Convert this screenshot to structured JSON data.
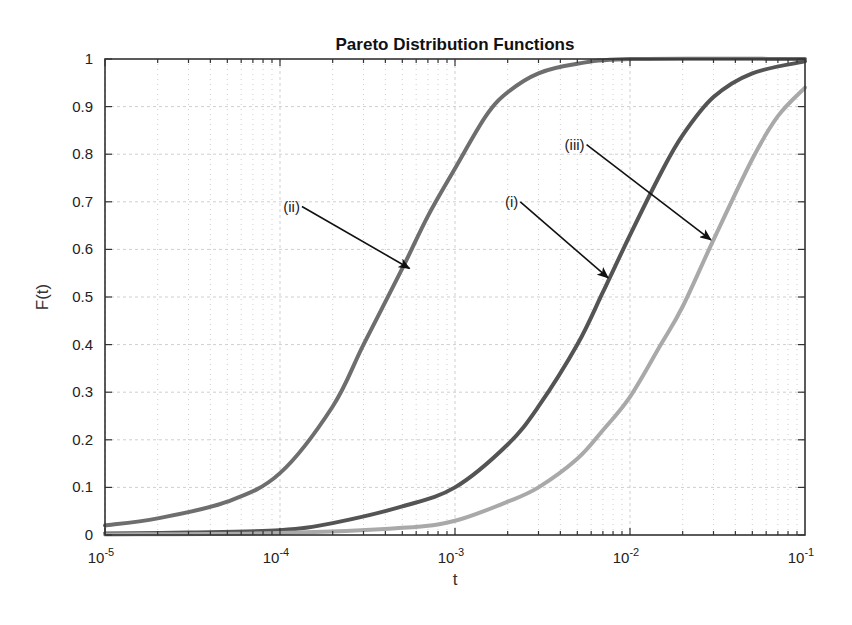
{
  "chart_data": {
    "type": "line",
    "title": "Pareto Distribution Functions",
    "xlabel": "t",
    "ylabel": "F(t)",
    "xscale": "log",
    "xlim": [
      1e-05,
      0.1
    ],
    "ylim": [
      0,
      1
    ],
    "grid": true,
    "minor_grid": true,
    "legend": null,
    "x_ticks": [
      {
        "value": 1e-05,
        "base": "10",
        "exp": "-5"
      },
      {
        "value": 0.0001,
        "base": "10",
        "exp": "-4"
      },
      {
        "value": 0.001,
        "base": "10",
        "exp": "-3"
      },
      {
        "value": 0.01,
        "base": "10",
        "exp": "-2"
      },
      {
        "value": 0.1,
        "base": "10",
        "exp": "-1"
      }
    ],
    "y_ticks": [
      "0",
      "0.1",
      "0.2",
      "0.3",
      "0.4",
      "0.5",
      "0.6",
      "0.7",
      "0.8",
      "0.9",
      "1"
    ],
    "series": [
      {
        "name": "(ii)",
        "color": "#6e6e6e",
        "x": [
          1e-05,
          2e-05,
          5e-05,
          0.0001,
          0.0002,
          0.0003,
          0.0005,
          0.0007,
          0.001,
          0.0015,
          0.002,
          0.003,
          0.005,
          0.01,
          0.1
        ],
        "y": [
          0.02,
          0.035,
          0.07,
          0.13,
          0.27,
          0.4,
          0.56,
          0.67,
          0.77,
          0.88,
          0.93,
          0.97,
          0.99,
          1.0,
          1.0
        ]
      },
      {
        "name": "(i)",
        "color": "#545454",
        "x": [
          1e-05,
          3e-05,
          0.0001,
          0.0002,
          0.0005,
          0.001,
          0.002,
          0.003,
          0.005,
          0.007,
          0.01,
          0.015,
          0.02,
          0.03,
          0.05,
          0.1
        ],
        "y": [
          0.003,
          0.005,
          0.01,
          0.025,
          0.06,
          0.1,
          0.19,
          0.27,
          0.4,
          0.51,
          0.63,
          0.76,
          0.84,
          0.92,
          0.97,
          0.995
        ]
      },
      {
        "name": "(iii)",
        "color": "#a9a9a9",
        "x": [
          1e-05,
          0.0001,
          0.0005,
          0.001,
          0.002,
          0.003,
          0.005,
          0.007,
          0.01,
          0.015,
          0.02,
          0.03,
          0.05,
          0.07,
          0.1
        ],
        "y": [
          0.001,
          0.004,
          0.015,
          0.03,
          0.07,
          0.1,
          0.16,
          0.22,
          0.29,
          0.4,
          0.48,
          0.62,
          0.79,
          0.88,
          0.94
        ]
      }
    ],
    "annotations": [
      {
        "text": "(ii)",
        "label_x": 0.00013,
        "label_y": 0.69,
        "arrow_to_x": 0.00055,
        "arrow_to_y": 0.56
      },
      {
        "text": "(i)",
        "label_x": 0.0023,
        "label_y": 0.7,
        "arrow_to_x": 0.0075,
        "arrow_to_y": 0.54
      },
      {
        "text": "(iii)",
        "label_x": 0.0055,
        "label_y": 0.82,
        "arrow_to_x": 0.029,
        "arrow_to_y": 0.62
      }
    ]
  },
  "colors": {
    "axis": "#333333",
    "grid": "#cfcfcf",
    "background": "#ffffff"
  }
}
